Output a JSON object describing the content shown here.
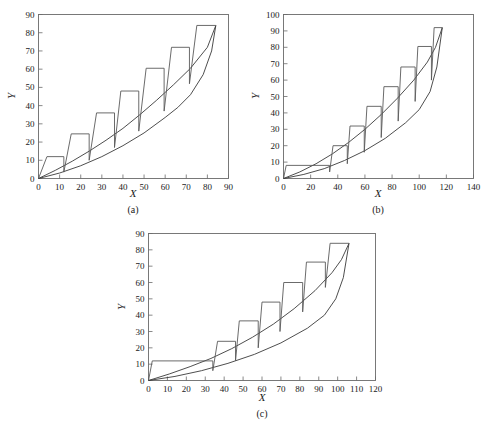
{
  "figure": {
    "background": "#ffffff",
    "line_color": "#3a3a3a",
    "axis_color": "#6b6b6b"
  },
  "chart_data": [
    {
      "type": "line",
      "panel_label": "(a)",
      "title": "",
      "xlabel": "X",
      "ylabel": "Y",
      "xlim": [
        0,
        90
      ],
      "ylim": [
        0,
        90
      ],
      "xticks": [
        0,
        10,
        20,
        30,
        40,
        50,
        60,
        70,
        80,
        90
      ],
      "yticks": [
        0,
        10,
        20,
        30,
        40,
        50,
        60,
        70,
        80,
        90
      ],
      "grid": false,
      "legend": "none",
      "series": [
        {
          "name": "upper-curve",
          "comment": "smooth convex curve from origin to top-right, upper of the two smooth arcs",
          "points": [
            [
              0,
              0
            ],
            [
              8,
              4.5
            ],
            [
              16,
              9.5
            ],
            [
              24,
              15
            ],
            [
              32,
              21
            ],
            [
              40,
              27.5
            ],
            [
              48,
              35
            ],
            [
              56,
              43
            ],
            [
              64,
              51.5
            ],
            [
              72,
              60.5
            ],
            [
              80,
              72
            ],
            [
              84,
              84
            ]
          ]
        },
        {
          "name": "lower-curve",
          "comment": "smooth convex curve from origin to top-right, lower of the two smooth arcs",
          "points": [
            [
              0,
              0
            ],
            [
              10,
              3
            ],
            [
              20,
              7
            ],
            [
              30,
              12
            ],
            [
              40,
              18
            ],
            [
              50,
              25
            ],
            [
              60,
              33.5
            ],
            [
              66,
              39
            ],
            [
              72,
              46
            ],
            [
              78,
              57
            ],
            [
              82,
              70
            ],
            [
              84,
              84
            ]
          ]
        },
        {
          "name": "staircase",
          "comment": "step polyline: rise, flat top, vertical drop at each step",
          "points": [
            [
              0,
              0
            ],
            [
              4,
              12
            ],
            [
              12,
              12
            ],
            [
              12,
              3.5
            ],
            [
              15.5,
              24.5
            ],
            [
              24,
              24.5
            ],
            [
              24,
              10
            ],
            [
              27.5,
              36
            ],
            [
              36,
              36
            ],
            [
              36,
              17
            ],
            [
              39,
              48
            ],
            [
              47.5,
              48
            ],
            [
              47.5,
              26
            ],
            [
              51,
              60.5
            ],
            [
              59.5,
              60.5
            ],
            [
              59.5,
              37
            ],
            [
              63,
              72
            ],
            [
              71.5,
              72
            ],
            [
              71.5,
              52
            ],
            [
              75,
              84
            ],
            [
              84,
              84
            ]
          ]
        }
      ]
    },
    {
      "type": "line",
      "panel_label": "(b)",
      "title": "",
      "xlabel": "X",
      "ylabel": "Y",
      "xlim": [
        0,
        140
      ],
      "ylim": [
        0,
        100
      ],
      "xticks": [
        0,
        20,
        40,
        60,
        80,
        100,
        120,
        140
      ],
      "yticks": [
        0,
        10,
        20,
        30,
        40,
        50,
        60,
        70,
        80,
        90,
        100
      ],
      "grid": false,
      "legend": "none",
      "series": [
        {
          "name": "upper-curve",
          "comment": "upper smooth convex arc origin to (117, 92)",
          "points": [
            [
              0,
              0
            ],
            [
              12,
              4
            ],
            [
              24,
              9
            ],
            [
              36,
              15
            ],
            [
              48,
              22
            ],
            [
              60,
              30
            ],
            [
              72,
              39
            ],
            [
              84,
              49
            ],
            [
              96,
              60
            ],
            [
              106,
              71
            ],
            [
              112,
              80
            ],
            [
              117,
              92
            ]
          ]
        },
        {
          "name": "lower-curve",
          "comment": "lower smooth convex arc origin to (117, 92)",
          "points": [
            [
              0,
              0
            ],
            [
              15,
              2.5
            ],
            [
              30,
              6
            ],
            [
              45,
              11
            ],
            [
              60,
              17
            ],
            [
              75,
              24.5
            ],
            [
              90,
              34
            ],
            [
              100,
              42
            ],
            [
              108,
              53
            ],
            [
              113,
              68
            ],
            [
              117,
              92
            ]
          ]
        },
        {
          "name": "staircase",
          "comment": "long flat shelf at y=8 then stepped rises",
          "points": [
            [
              0,
              0
            ],
            [
              2,
              8
            ],
            [
              34,
              8
            ],
            [
              34,
              4
            ],
            [
              36.5,
              20
            ],
            [
              47,
              20
            ],
            [
              47,
              9
            ],
            [
              49,
              32
            ],
            [
              59.5,
              32
            ],
            [
              59.5,
              16
            ],
            [
              61.5,
              44
            ],
            [
              72,
              44
            ],
            [
              72,
              25
            ],
            [
              74,
              56
            ],
            [
              84.5,
              56
            ],
            [
              84.5,
              35
            ],
            [
              86.5,
              68
            ],
            [
              97,
              68
            ],
            [
              97,
              47
            ],
            [
              99,
              80.5
            ],
            [
              109,
              80.5
            ],
            [
              109,
              60
            ],
            [
              111,
              92
            ],
            [
              117,
              92
            ]
          ]
        }
      ]
    },
    {
      "type": "line",
      "panel_label": "(c)",
      "title": "",
      "xlabel": "X",
      "ylabel": "Y",
      "xlim": [
        0,
        120
      ],
      "ylim": [
        0,
        90
      ],
      "xticks": [
        0,
        10,
        20,
        30,
        40,
        50,
        60,
        70,
        80,
        90,
        100,
        110,
        120
      ],
      "yticks": [
        0,
        10,
        20,
        30,
        40,
        50,
        60,
        70,
        80,
        90
      ],
      "grid": false,
      "legend": "none",
      "series": [
        {
          "name": "upper-curve",
          "comment": "upper smooth convex arc origin to (106, 84)",
          "points": [
            [
              0,
              0
            ],
            [
              11,
              4
            ],
            [
              22,
              8.5
            ],
            [
              33,
              13.5
            ],
            [
              44,
              19.5
            ],
            [
              55,
              26.5
            ],
            [
              66,
              34.5
            ],
            [
              77,
              44
            ],
            [
              88,
              55
            ],
            [
              97,
              66
            ],
            [
              102,
              74
            ],
            [
              106,
              84
            ]
          ]
        },
        {
          "name": "lower-curve",
          "comment": "lower smooth convex arc origin to (106, 84)",
          "points": [
            [
              0,
              0
            ],
            [
              14,
              2.5
            ],
            [
              28,
              6
            ],
            [
              42,
              10.5
            ],
            [
              56,
              16
            ],
            [
              70,
              23
            ],
            [
              84,
              32
            ],
            [
              93,
              40
            ],
            [
              99,
              50
            ],
            [
              103,
              63
            ],
            [
              106,
              84
            ]
          ]
        },
        {
          "name": "staircase",
          "comment": "flat shelf at y=12 then stepped rises",
          "points": [
            [
              0,
              0
            ],
            [
              2,
              12
            ],
            [
              34,
              12
            ],
            [
              34,
              6
            ],
            [
              36.5,
              24
            ],
            [
              46,
              24
            ],
            [
              46,
              12
            ],
            [
              48,
              36.5
            ],
            [
              58,
              36.5
            ],
            [
              58,
              20
            ],
            [
              60,
              48
            ],
            [
              69.5,
              48
            ],
            [
              69.5,
              30
            ],
            [
              71.5,
              60
            ],
            [
              81.5,
              60
            ],
            [
              81.5,
              42
            ],
            [
              83.5,
              72.5
            ],
            [
              93.5,
              72.5
            ],
            [
              93.5,
              57
            ],
            [
              96,
              84
            ],
            [
              106,
              84
            ]
          ]
        }
      ]
    }
  ]
}
